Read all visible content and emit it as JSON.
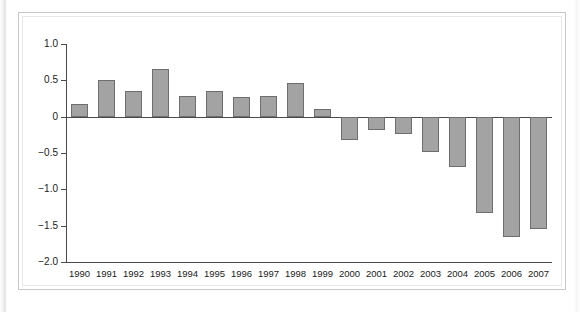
{
  "chart_data": {
    "type": "bar",
    "title": "",
    "subtitle": "",
    "xlabel": "",
    "ylabel": "",
    "categories": [
      "1990",
      "1991",
      "1992",
      "1993",
      "1994",
      "1995",
      "1996",
      "1997",
      "1998",
      "1999",
      "2000",
      "2001",
      "2002",
      "2003",
      "2004",
      "2005",
      "2006",
      "2007"
    ],
    "values": [
      0.18,
      0.51,
      0.36,
      0.65,
      0.29,
      0.36,
      0.27,
      0.29,
      0.46,
      0.1,
      -0.32,
      -0.19,
      -0.24,
      -0.49,
      -0.69,
      -1.32,
      -1.65,
      -1.54
    ],
    "ylim": [
      -2.0,
      1.0
    ],
    "yticks": [
      1.0,
      0.5,
      0,
      -0.5,
      -1.0,
      -1.5,
      -2.0
    ],
    "ytick_labels": [
      "1.0",
      "0.5",
      "0",
      "−0.5",
      "−1.0",
      "−1.5",
      "−2.0"
    ],
    "grid": false,
    "legend": null,
    "bar_color": "#a3a3a3",
    "bar_edge_color": "#6e6e6e",
    "axis_color": "#4a4a4a"
  },
  "figure": {
    "caption": ""
  }
}
